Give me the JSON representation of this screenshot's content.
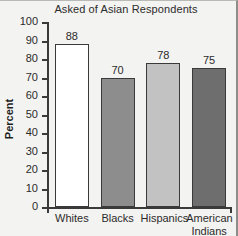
{
  "chart_data": {
    "type": "bar",
    "title": "Asked of Asian Respondents",
    "xlabel": "",
    "ylabel": "Percent",
    "ylim": [
      0,
      100
    ],
    "ytick_step": 10,
    "yticks": [
      100,
      90,
      80,
      70,
      60,
      50,
      40,
      30,
      20,
      10,
      0
    ],
    "grid": false,
    "legend": false,
    "categories": [
      "Whites",
      "Blacks",
      "Hispanics",
      "American Indians"
    ],
    "values": [
      88,
      70,
      78,
      75
    ],
    "bars": [
      {
        "category": "Whites",
        "category_line1": "Whites",
        "category_line2": "",
        "value": 88,
        "value_label": "88",
        "fill": "#ffffff",
        "edge": "#3a3a3a"
      },
      {
        "category": "Blacks",
        "category_line1": "Blacks",
        "category_line2": "",
        "value": 70,
        "value_label": "70",
        "fill": "#8d8d8d",
        "edge": "#3a3a3a"
      },
      {
        "category": "Hispanics",
        "category_line1": "Hispanics",
        "category_line2": "",
        "value": 78,
        "value_label": "78",
        "fill": "#c2c2c2",
        "edge": "#3a3a3a"
      },
      {
        "category": "American Indians",
        "category_line1": "American",
        "category_line2": "Indians",
        "value": 75,
        "value_label": "75",
        "fill": "#6e6e6e",
        "edge": "#3a3a3a"
      }
    ],
    "colors": {
      "background": "#f3f3f1",
      "axis": "#3a3a3a",
      "text": "#2b2b2b",
      "frame": "#8d8d89"
    }
  }
}
